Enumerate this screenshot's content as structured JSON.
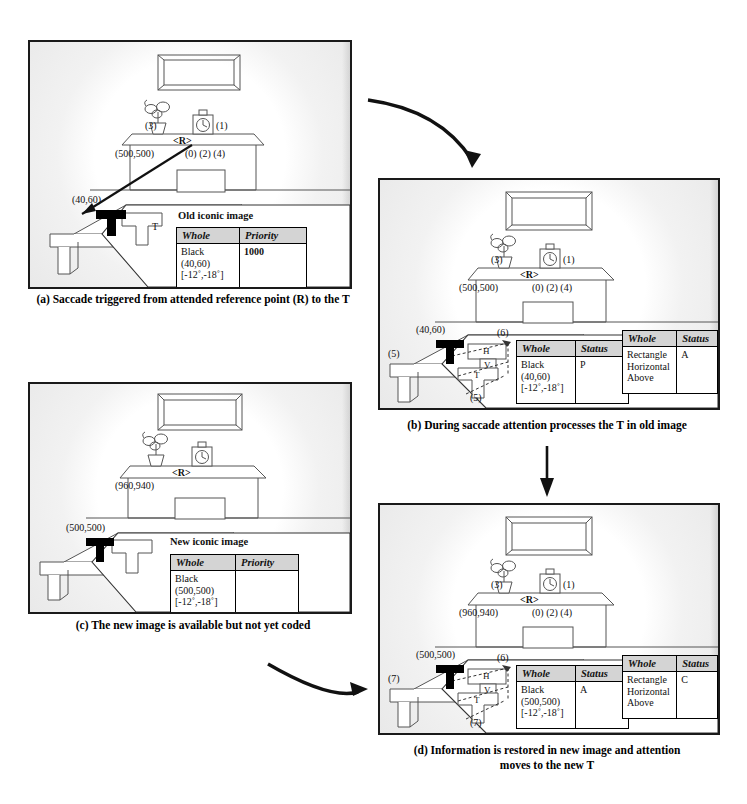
{
  "figure": {
    "panels": [
      {
        "id": "a",
        "caption": "(a) Saccade triggered from attended reference point (R) to the T",
        "scene": {
          "reference_label": "<R>",
          "shelf_coord": "(500,500)",
          "shelf_indices": "(0) (2) (4)",
          "plant_index": "(3)",
          "clock_index": "(1)",
          "table_coord": "(40,60)",
          "callout_letter": "T"
        },
        "tables": [
          {
            "title": "Old iconic image",
            "headers": [
              "Whole",
              "Priority"
            ],
            "rows": [
              {
                "whole": [
                  "Black",
                  "(40,60)",
                  "[-12˚,-18˚]"
                ],
                "value": "1000",
                "bold": true
              }
            ]
          }
        ]
      },
      {
        "id": "b",
        "caption": "(b) During saccade attention processes the T in old image",
        "scene": {
          "reference_label": "<R>",
          "shelf_coord": "(500,500)",
          "shelf_indices": "(0) (2) (4)",
          "plant_index": "(3)",
          "clock_index": "(1)",
          "table_coord": "(40,60)",
          "table_index": "(5)",
          "callout_top_index": "(6)",
          "callout_bottom_index": "(5)",
          "part_h": "H",
          "part_v": "V",
          "part_t": "T"
        },
        "tables": [
          {
            "title": "",
            "headers": [
              "Whole",
              "Status"
            ],
            "rows": [
              {
                "whole": [
                  "Black",
                  "(40,60)",
                  "[-12˚,-18˚]"
                ],
                "value": "P",
                "bold": false
              }
            ]
          },
          {
            "title": "",
            "headers": [
              "Whole",
              "Status"
            ],
            "rows": [
              {
                "whole": [
                  "Rectangle",
                  "Horizontal",
                  "Above"
                ],
                "value": "A",
                "bold": false
              }
            ]
          }
        ]
      },
      {
        "id": "c",
        "caption": "(c) The new image is available but not yet coded",
        "scene": {
          "reference_label": "<R>",
          "shelf_coord": "(960,940)",
          "shelf_indices": "",
          "plant_index": "",
          "clock_index": "",
          "table_coord": "(500,500)",
          "callout_letter": ""
        },
        "tables": [
          {
            "title": "New iconic image",
            "headers": [
              "Whole",
              "Priority"
            ],
            "rows": [
              {
                "whole": [
                  "Black",
                  "(500,500)",
                  "[-12˚,-18˚]"
                ],
                "value": "",
                "bold": true
              }
            ]
          }
        ]
      },
      {
        "id": "d",
        "caption": "(d) Information is restored in new image and attention",
        "caption_line2": "moves to the new T",
        "scene": {
          "reference_label": "<R>",
          "shelf_coord": "(960,940)",
          "shelf_indices": "(0) (2) (4)",
          "plant_index": "(3)",
          "clock_index": "(1)",
          "table_coord": "(500,500)",
          "table_index": "(7)",
          "callout_top_index": "(6)",
          "callout_bottom_index": "(7)",
          "part_h": "H",
          "part_v": "V",
          "part_t": "T"
        },
        "tables": [
          {
            "title": "",
            "headers": [
              "Whole",
              "Status"
            ],
            "rows": [
              {
                "whole": [
                  "Black",
                  "(500,500)",
                  "[-12˚,-18˚]"
                ],
                "value": "A",
                "bold": false
              }
            ]
          },
          {
            "title": "",
            "headers": [
              "Whole",
              "Status"
            ],
            "rows": [
              {
                "whole": [
                  "Rectangle",
                  "Horizontal",
                  "Above"
                ],
                "value": "C",
                "bold": false
              }
            ]
          }
        ]
      }
    ],
    "arrows": [
      {
        "name": "arrow-a-to-b",
        "style": "curved"
      },
      {
        "name": "arrow-b-to-d",
        "style": "straight-vertical"
      },
      {
        "name": "arrow-c-to-d",
        "style": "curved"
      }
    ],
    "colors": {
      "frame": "#1a1a1a",
      "header_fill": "#d4d4d4",
      "t_shape": "#000000",
      "line": "#4a4a4a"
    }
  }
}
